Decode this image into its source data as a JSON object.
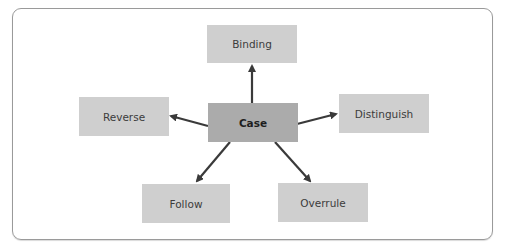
{
  "diagram": {
    "type": "hub-and-spoke",
    "center": {
      "id": "case",
      "label": "Case"
    },
    "nodes": [
      {
        "id": "binding",
        "label": "Binding"
      },
      {
        "id": "reverse",
        "label": "Reverse"
      },
      {
        "id": "distinguish",
        "label": "Distinguish"
      },
      {
        "id": "follow",
        "label": "Follow"
      },
      {
        "id": "overrule",
        "label": "Overrule"
      }
    ],
    "edges": [
      {
        "from": "case",
        "to": "binding"
      },
      {
        "from": "case",
        "to": "reverse"
      },
      {
        "from": "case",
        "to": "distinguish"
      },
      {
        "from": "case",
        "to": "follow"
      },
      {
        "from": "case",
        "to": "overrule"
      }
    ],
    "colors": {
      "node_fill": "#cfcfcf",
      "center_fill": "#ababab",
      "arrow": "#3a3a3a",
      "frame_border": "#9a9a9a"
    }
  }
}
